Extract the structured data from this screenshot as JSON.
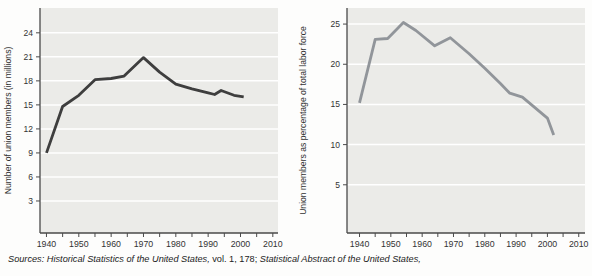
{
  "figure": {
    "source_note": {
      "segments": [
        {
          "text": "Sources: ",
          "italic": true
        },
        {
          "text": "Historical Statistics of the United States,",
          "italic": true
        },
        {
          "text": " vol. 1, 178; ",
          "italic": false
        },
        {
          "text": "Statistical Abstract of the United States,",
          "italic": true
        }
      ]
    }
  },
  "chart_data": [
    {
      "type": "line",
      "title": "",
      "xlabel": "",
      "ylabel": "Number of union members (in millions)",
      "x": [
        1940,
        1945,
        1950,
        1955,
        1960,
        1964,
        1970,
        1975,
        1980,
        1985,
        1990,
        1992,
        1994,
        1998,
        2001
      ],
      "values": [
        9.0,
        14.8,
        16.2,
        18.15,
        18.3,
        18.6,
        20.9,
        19.1,
        17.6,
        17.0,
        16.5,
        16.3,
        16.8,
        16.2,
        16.0
      ],
      "xlim": [
        1938,
        2011.6
      ],
      "ylim": [
        -1,
        27.1
      ],
      "yticks": [
        3,
        6,
        9,
        12,
        15,
        18,
        21,
        24
      ],
      "xticks": [
        1940,
        1950,
        1960,
        1970,
        1980,
        1990,
        2000,
        2010
      ],
      "xtick_minor_step": 5,
      "grid": "horizontal",
      "legend": "none",
      "line_color": "#3e3e3e",
      "plot_bg": "#ebebe8",
      "grid_color": "#ffffff",
      "axis_color": "#4a4a4a",
      "text_color": "#333333"
    },
    {
      "type": "line",
      "title": "",
      "xlabel": "",
      "ylabel": "Union members as percentage of total labor force",
      "x": [
        1940,
        1945,
        1949,
        1954,
        1958,
        1964,
        1969,
        1975,
        1980,
        1985,
        1988,
        1992,
        1996,
        2000,
        2002
      ],
      "values": [
        15.2,
        23.1,
        23.2,
        25.2,
        24.2,
        22.3,
        23.3,
        21.3,
        19.5,
        17.6,
        16.4,
        15.9,
        14.6,
        13.3,
        11.2
      ],
      "xlim": [
        1936,
        2012
      ],
      "ylim": [
        -1,
        27
      ],
      "yticks": [
        5,
        10,
        15,
        20,
        25
      ],
      "xticks": [
        1940,
        1950,
        1960,
        1970,
        1980,
        1990,
        2000,
        2010
      ],
      "xtick_minor_step": 5,
      "grid": "horizontal",
      "legend": "none",
      "line_color": "#91959a",
      "plot_bg": "#ebebe8",
      "grid_color": "#ffffff",
      "axis_color": "#4a4a4a",
      "text_color": "#333333"
    }
  ]
}
